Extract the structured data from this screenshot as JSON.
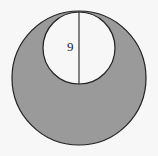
{
  "diagram": {
    "type": "geometry",
    "outer_circle": {
      "cx": 79,
      "cy": 78,
      "r": 67,
      "fill": "#9a9a9a",
      "stroke": "#222222"
    },
    "inner_circle": {
      "cx": 79,
      "cy": 48,
      "r": 36,
      "fill": "#f7f7f7",
      "stroke": "#222222"
    },
    "diameter_segment": {
      "x": 79,
      "y1": 12,
      "y2": 84,
      "stroke": "#222222"
    },
    "label": {
      "text": "9",
      "x": 71,
      "y": 50
    },
    "colors": {
      "background": "#f7f7f7",
      "shaded": "#9a9a9a",
      "line": "#222222"
    }
  }
}
